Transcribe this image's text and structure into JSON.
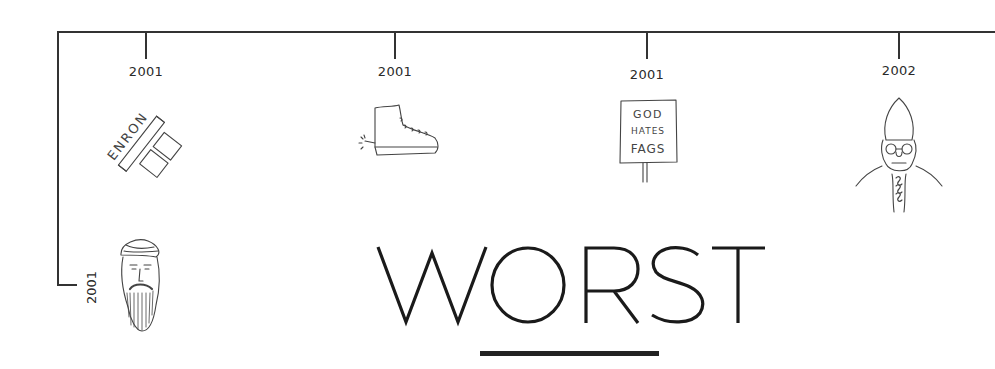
{
  "timeline": {
    "colors": {
      "line": "#333333",
      "text": "#2a2a2a",
      "title": "#1a1a1a"
    },
    "events": [
      {
        "year": "2001",
        "icon": "enron-logo-sketch",
        "sketch_text": "ENRON"
      },
      {
        "year": "2001",
        "icon": "shoe-bomb-sketch"
      },
      {
        "year": "2001",
        "icon": "protest-sign-sketch",
        "sketch_text": [
          "GOD",
          "HATES",
          "FAGS"
        ]
      },
      {
        "year": "2002",
        "icon": "bishop-sketch"
      }
    ],
    "branch_event": {
      "year": "2001",
      "icon": "bearded-man-turban-sketch"
    }
  },
  "heading": {
    "title": "WORST"
  }
}
